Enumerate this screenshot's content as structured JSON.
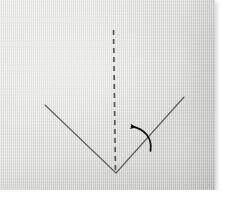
{
  "figure": {
    "kind": "origami-step-photograph",
    "alt_description": "Photograph of a light gray square of paper with a dashed vertical fold line down the middle, a V-shaped crease meeting at the bottom center, and a curved arrow pointing left",
    "photo_background_color": "#dcddda",
    "line_color": "#55565a",
    "arrow_color": "#111111"
  },
  "caption": {
    "step_number": "4",
    "text": "Valley fold the right corner to the"
  },
  "diagram": {
    "fold_line": {
      "name": "valley-fold-dashed-line",
      "style": "dashed",
      "x": 113,
      "y_start": 30,
      "y_end": 172,
      "dash_pattern": "5 4"
    },
    "crease_left": {
      "name": "left-crease-line",
      "x1": 45,
      "y1": 105,
      "x2": 116,
      "y2": 173
    },
    "crease_right": {
      "name": "right-crease-line",
      "x1": 116,
      "y1": 173,
      "x2": 184,
      "y2": 97
    },
    "arrow": {
      "name": "fold-direction-arrow",
      "direction": "left",
      "tip_x": 128,
      "tip_y": 127,
      "tail_x": 150,
      "tail_y": 150
    }
  }
}
